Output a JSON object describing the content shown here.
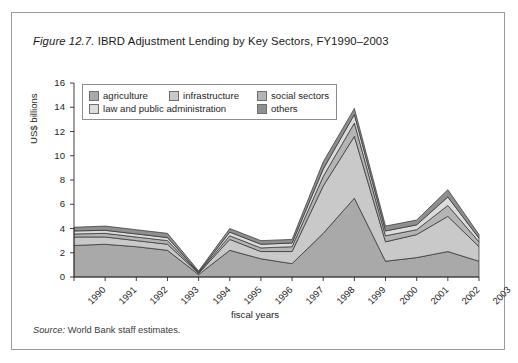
{
  "figure": {
    "number": "Figure 12.7.",
    "title": " IBRD Adjustment Lending by Key Sectors, FY1990–2003",
    "source_word": "Source:",
    "source_text": " World Bank staff estimates."
  },
  "legend": {
    "items": [
      {
        "label": "agriculture",
        "color": "#a9a9a9"
      },
      {
        "label": "infrastructure",
        "color": "#c9c9c9"
      },
      {
        "label": "social sectors",
        "color": "#b4b4b4"
      },
      {
        "label": "law and public administration",
        "color": "#dcdcdc"
      },
      {
        "label": "others",
        "color": "#8f8f8f"
      }
    ]
  },
  "chart_data": {
    "type": "area",
    "title": "IBRD Adjustment Lending by Key Sectors, FY1990–2003",
    "xlabel": "fiscal years",
    "ylabel": "US$ billions",
    "categories": [
      "1990",
      "1991",
      "1992",
      "1993",
      "1994",
      "1995",
      "1996",
      "1997",
      "1998",
      "1999",
      "2000",
      "2001",
      "2002",
      "2003"
    ],
    "ylim": [
      0,
      16
    ],
    "yticks": [
      0,
      2,
      4,
      6,
      8,
      10,
      12,
      14,
      16
    ],
    "grid": false,
    "legend_position": "upper-left-inside",
    "stacked": true,
    "series": [
      {
        "name": "agriculture",
        "values": [
          2.6,
          2.7,
          2.5,
          2.2,
          0.2,
          2.2,
          1.5,
          1.1,
          3.6,
          6.5,
          1.3,
          1.6,
          2.1,
          1.3
        ]
      },
      {
        "name": "infrastructure",
        "values": [
          0.7,
          0.6,
          0.5,
          0.5,
          0.1,
          0.9,
          0.6,
          1.0,
          3.9,
          5.1,
          1.6,
          1.9,
          2.9,
          1.2
        ]
      },
      {
        "name": "social sectors",
        "values": [
          0.25,
          0.3,
          0.3,
          0.3,
          0.05,
          0.3,
          0.3,
          0.4,
          0.8,
          1.1,
          0.5,
          0.4,
          0.9,
          0.4
        ]
      },
      {
        "name": "law and public administration",
        "values": [
          0.25,
          0.25,
          0.25,
          0.25,
          0.05,
          0.3,
          0.3,
          0.3,
          0.6,
          0.7,
          0.4,
          0.4,
          0.7,
          0.3
        ]
      },
      {
        "name": "others",
        "values": [
          0.3,
          0.35,
          0.35,
          0.35,
          0.1,
          0.3,
          0.3,
          0.3,
          0.6,
          0.5,
          0.4,
          0.4,
          0.6,
          0.3
        ]
      }
    ],
    "totals": [
      4.1,
      4.2,
      3.9,
      3.6,
      0.5,
      4.0,
      3.0,
      3.1,
      9.5,
      13.9,
      4.2,
      4.7,
      7.2,
      3.5
    ]
  },
  "axis": {
    "y_tick_labels": [
      "16",
      "14",
      "12",
      "10",
      "8",
      "6",
      "4",
      "2",
      "0"
    ],
    "x_tick_labels": [
      "1990",
      "1991",
      "1992",
      "1993",
      "1994",
      "1995",
      "1996",
      "1997",
      "1998",
      "1999",
      "2000",
      "2001",
      "2002",
      "2003"
    ]
  }
}
